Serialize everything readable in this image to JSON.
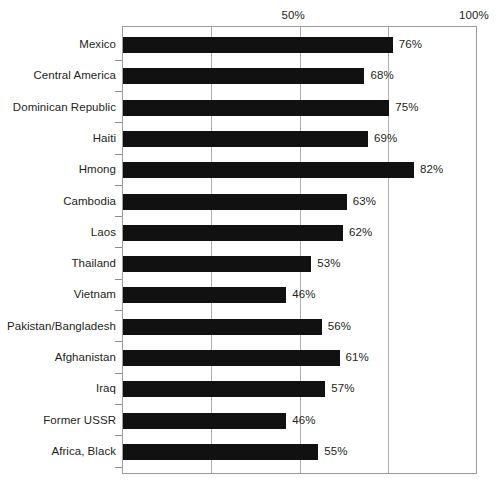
{
  "chart_data": {
    "type": "bar",
    "orientation": "horizontal",
    "title": "",
    "xlabel": "",
    "ylabel": "",
    "xlim": [
      0,
      100
    ],
    "grid": true,
    "gridlines": [
      25,
      50,
      75
    ],
    "axis_ticks": [
      {
        "value": 50,
        "label": "50%"
      },
      {
        "value": 100,
        "label": "100%"
      }
    ],
    "axis_position": "top",
    "value_suffix": "%",
    "bar_color": "#111111",
    "categories": [
      "Mexico",
      "Central America",
      "Dominican Republic",
      "Haiti",
      "Hmong",
      "Cambodia",
      "Laos",
      "Thailand",
      "Vietnam",
      "Pakistan/Bangladesh",
      "Afghanistan",
      "Iraq",
      "Former USSR",
      "Africa, Black"
    ],
    "values": [
      76,
      68,
      75,
      69,
      82,
      63,
      62,
      53,
      46,
      56,
      61,
      57,
      46,
      55
    ],
    "value_labels": [
      "76%",
      "68%",
      "75%",
      "69%",
      "82%",
      "63%",
      "62%",
      "53%",
      "46%",
      "56%",
      "61%",
      "57%",
      "46%",
      "55%"
    ]
  }
}
